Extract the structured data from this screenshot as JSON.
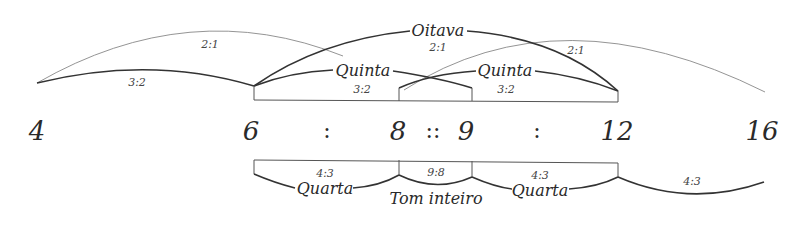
{
  "diagram": {
    "numbers": [
      {
        "value": "4",
        "x": 37
      },
      {
        "value": "6",
        "x": 251
      },
      {
        "value": "8",
        "x": 398
      },
      {
        "value": "9",
        "x": 466
      },
      {
        "value": "12",
        "x": 617
      },
      {
        "value": "16",
        "x": 762
      }
    ],
    "separators": [
      {
        "symbol": ":",
        "x": 327
      },
      {
        "symbol": "::",
        "x": 433
      },
      {
        "symbol": ":",
        "x": 537
      }
    ],
    "upper_intervals": {
      "octave_4_8": {
        "ratio": "2:1"
      },
      "fifth_4_6": {
        "ratio": "3:2"
      },
      "octave_6_12": {
        "label": "Oitava",
        "ratio": "2:1"
      },
      "fifth_6_9": {
        "label": "Quinta",
        "ratio": "3:2"
      },
      "fifth_8_12": {
        "label": "Quinta",
        "ratio": "3:2"
      },
      "octave_8_16": {
        "ratio": "2:1"
      }
    },
    "lower_intervals": {
      "fourth_6_8": {
        "label": "Quarta",
        "ratio": "4:3"
      },
      "tone_8_9": {
        "label": "Tom inteiro",
        "ratio": "9:8"
      },
      "fourth_9_12": {
        "label": "Quarta",
        "ratio": "4:3"
      },
      "fourth_12_16": {
        "ratio": "4:3"
      }
    }
  }
}
